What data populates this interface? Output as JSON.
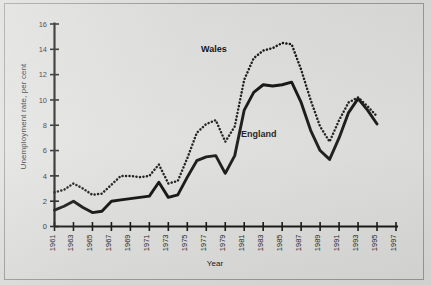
{
  "chart_data": {
    "type": "line",
    "title": "",
    "xlabel": "Year",
    "ylabel": "Unemployment rate, per cent",
    "xlim": [
      1961,
      1997
    ],
    "ylim": [
      0,
      16
    ],
    "yticks": [
      0,
      2,
      4,
      6,
      8,
      10,
      12,
      14,
      16
    ],
    "xticks": [
      1961,
      1963,
      1965,
      1967,
      1969,
      1971,
      1973,
      1975,
      1977,
      1979,
      1981,
      1983,
      1985,
      1987,
      1989,
      1991,
      1993,
      1995,
      1997
    ],
    "xtick_labels": [
      "1961",
      "1963",
      "1965",
      "1967",
      "1969",
      "1971",
      "1973",
      "1975",
      "1977",
      "1979",
      "1981",
      "1983",
      "1985",
      "1987",
      "1989",
      "1991",
      "1993",
      "1995",
      "1997"
    ],
    "ytick_labels": [
      "0",
      "2",
      "4",
      "6",
      "8",
      "10",
      "12",
      "14",
      "16"
    ],
    "grid": false,
    "legend": "inline-annotations",
    "x": [
      1961,
      1962,
      1963,
      1964,
      1965,
      1966,
      1967,
      1968,
      1969,
      1970,
      1971,
      1972,
      1973,
      1974,
      1975,
      1976,
      1977,
      1978,
      1979,
      1980,
      1981,
      1982,
      1983,
      1984,
      1985,
      1986,
      1987,
      1988,
      1989,
      1990,
      1991,
      1992,
      1993,
      1994,
      1995
    ],
    "series": [
      {
        "name": "Wales",
        "style": "dotted",
        "color": "#111111",
        "values": [
          2.7,
          2.9,
          3.4,
          3.0,
          2.5,
          2.6,
          3.3,
          4.0,
          4.0,
          3.9,
          4.0,
          4.9,
          3.4,
          3.6,
          5.4,
          7.4,
          8.1,
          8.4,
          6.7,
          7.9,
          11.6,
          13.3,
          13.9,
          14.1,
          14.5,
          14.4,
          12.4,
          10.0,
          7.9,
          6.7,
          8.4,
          9.8,
          10.2,
          9.5,
          8.7
        ]
      },
      {
        "name": "England",
        "style": "solid",
        "color": "#0a0a0a",
        "values": [
          1.3,
          1.6,
          2.0,
          1.5,
          1.1,
          1.2,
          2.0,
          2.1,
          2.2,
          2.3,
          2.4,
          3.5,
          2.3,
          2.5,
          3.9,
          5.2,
          5.5,
          5.6,
          4.2,
          5.6,
          9.2,
          10.6,
          11.2,
          11.1,
          11.2,
          11.4,
          9.8,
          7.6,
          6.0,
          5.3,
          7.0,
          9.0,
          10.1,
          9.2,
          8.1
        ]
      }
    ],
    "annotations": [
      {
        "text": "Wales",
        "x": 1980,
        "y": 13.2
      },
      {
        "text": "England",
        "x": 1984,
        "y": 7.6
      }
    ]
  }
}
